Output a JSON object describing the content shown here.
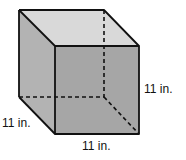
{
  "figure": {
    "shape": "cube",
    "colors": {
      "top_face": "#d9d9d9",
      "left_face": "#b3b3b3",
      "front_face": "#a6a6a6",
      "edge": "#111111",
      "background": "#ffffff"
    },
    "labels": {
      "height": "11 in.",
      "depth": "11 in.",
      "width": "11 in."
    }
  }
}
